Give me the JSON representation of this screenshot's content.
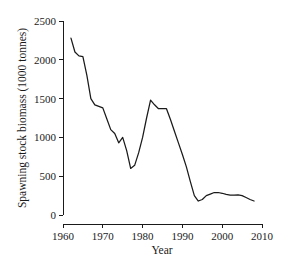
{
  "chart_data": {
    "type": "line",
    "title": "",
    "xlabel": "Year",
    "ylabel": "Spawning stock biomass (1000 tonnes)",
    "xlim": [
      1960,
      2010
    ],
    "ylim": [
      0,
      2500
    ],
    "xticks": [
      1960,
      1970,
      1980,
      1990,
      2000,
      2010
    ],
    "yticks": [
      0,
      500,
      1000,
      1500,
      2000,
      2500
    ],
    "grid": false,
    "legend": "none",
    "line_color": "#1a1a1a",
    "series": [
      {
        "name": "Spawning stock biomass",
        "x": [
          1962,
          1963,
          1964,
          1965,
          1966,
          1967,
          1968,
          1969,
          1970,
          1971,
          1972,
          1973,
          1974,
          1975,
          1976,
          1977,
          1978,
          1979,
          1980,
          1981,
          1982,
          1983,
          1984,
          1985,
          1986,
          1987,
          1988,
          1989,
          1990,
          1991,
          1992,
          1993,
          1994,
          1995,
          1996,
          1997,
          1998,
          1999,
          2000,
          2001,
          2002,
          2003,
          2004,
          2005,
          2006,
          2007,
          2008
        ],
        "values": [
          2280,
          2100,
          2050,
          2040,
          1800,
          1500,
          1420,
          1400,
          1380,
          1240,
          1100,
          1050,
          930,
          1000,
          830,
          600,
          640,
          800,
          1000,
          1250,
          1480,
          1420,
          1370,
          1370,
          1370,
          1230,
          1080,
          930,
          780,
          620,
          430,
          250,
          180,
          200,
          250,
          270,
          290,
          290,
          280,
          265,
          255,
          255,
          260,
          250,
          225,
          200,
          180
        ]
      }
    ]
  },
  "axes": {
    "x_tick_labels": [
      "1960",
      "1970",
      "1980",
      "1990",
      "2000",
      "2010"
    ],
    "y_tick_labels": [
      "0",
      "500",
      "1000",
      "1500",
      "2000",
      "2500"
    ],
    "x_axis_title": "Year",
    "y_axis_title": "Spawning stock biomass (1000 tonnes)"
  }
}
